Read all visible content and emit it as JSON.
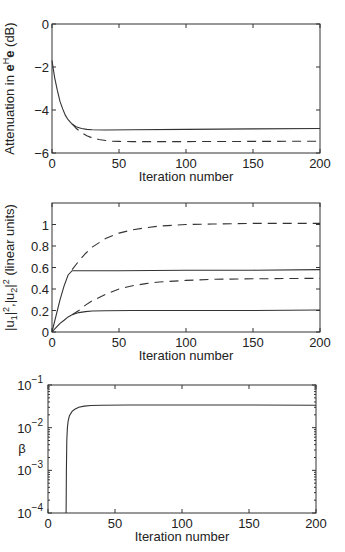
{
  "chart_data": [
    {
      "type": "line",
      "title": "",
      "xlabel": "Iteration number",
      "ylabel": "Attenuation in e^H e (dB)",
      "ylabel_parts": {
        "pre": "Attenuation in ",
        "bold": "e",
        "sup": "H",
        "bold2": "e",
        "post": " (dB)"
      },
      "xlim": [
        0,
        200
      ],
      "ylim": [
        -6,
        0
      ],
      "xticks": [
        0,
        50,
        100,
        150,
        200
      ],
      "yticks": [
        0,
        -2,
        -4,
        -6
      ],
      "grid": false,
      "series": [
        {
          "name": "solid",
          "style": "solid",
          "x": [
            0,
            1,
            2,
            4,
            6,
            8,
            10,
            12,
            15,
            18,
            22,
            26,
            30,
            40,
            60,
            100,
            150,
            200
          ],
          "y": [
            -1.7,
            -2.1,
            -2.5,
            -3.1,
            -3.6,
            -3.95,
            -4.25,
            -4.45,
            -4.65,
            -4.78,
            -4.86,
            -4.9,
            -4.92,
            -4.93,
            -4.92,
            -4.9,
            -4.88,
            -4.86
          ]
        },
        {
          "name": "dashed",
          "style": "dashed",
          "x": [
            15,
            18,
            22,
            26,
            30,
            35,
            40,
            45,
            50,
            60,
            80,
            100,
            150,
            200
          ],
          "y": [
            -4.65,
            -4.85,
            -5.05,
            -5.2,
            -5.3,
            -5.37,
            -5.42,
            -5.45,
            -5.46,
            -5.47,
            -5.47,
            -5.47,
            -5.46,
            -5.45
          ]
        }
      ]
    },
    {
      "type": "line",
      "title": "",
      "xlabel": "Iteration number",
      "ylabel": "|u1|^2, |u2|^2 (linear units)",
      "xlim": [
        0,
        200
      ],
      "ylim": [
        0,
        1.2
      ],
      "xticks": [
        0,
        50,
        100,
        150,
        200
      ],
      "yticks": [
        0,
        0.2,
        0.4,
        0.6,
        0.8,
        1
      ],
      "ytick_labels": [
        "0",
        "0.2",
        "0.4",
        "0.6",
        "0.8",
        "1"
      ],
      "grid": false,
      "series": [
        {
          "name": "u1 solid",
          "style": "solid",
          "x": [
            0,
            3,
            6,
            9,
            12,
            15,
            20,
            50,
            100,
            150,
            200
          ],
          "y": [
            0,
            0.15,
            0.3,
            0.43,
            0.53,
            0.57,
            0.57,
            0.57,
            0.575,
            0.575,
            0.58
          ]
        },
        {
          "name": "u1 dashed",
          "style": "dashed",
          "x": [
            15,
            20,
            25,
            30,
            40,
            50,
            60,
            70,
            80,
            100,
            120,
            150,
            200
          ],
          "y": [
            0.58,
            0.66,
            0.73,
            0.79,
            0.87,
            0.92,
            0.95,
            0.97,
            0.985,
            1.0,
            1.005,
            1.01,
            1.01
          ]
        },
        {
          "name": "u2 solid",
          "style": "solid",
          "x": [
            0,
            3,
            6,
            9,
            12,
            15,
            20,
            25,
            30,
            40,
            60,
            100,
            150,
            200
          ],
          "y": [
            0,
            0.04,
            0.08,
            0.11,
            0.14,
            0.16,
            0.18,
            0.19,
            0.195,
            0.198,
            0.2,
            0.2,
            0.2,
            0.205
          ]
        },
        {
          "name": "u2 dashed",
          "style": "dashed",
          "x": [
            15,
            20,
            25,
            30,
            40,
            50,
            60,
            70,
            80,
            100,
            120,
            150,
            200
          ],
          "y": [
            0.16,
            0.2,
            0.25,
            0.29,
            0.35,
            0.4,
            0.43,
            0.45,
            0.465,
            0.48,
            0.49,
            0.495,
            0.5
          ]
        }
      ]
    },
    {
      "type": "line",
      "title": "",
      "xlabel": "Iteration number",
      "ylabel": "β",
      "yscale": "log",
      "xlim": [
        0,
        200
      ],
      "ylim": [
        0.0001,
        0.1
      ],
      "xticks": [
        0,
        50,
        100,
        150,
        200
      ],
      "yticks": [
        0.1,
        0.01,
        0.001,
        0.0001
      ],
      "ytick_labels": [
        "10^-1",
        "10^-2",
        "10^-3",
        "10^-4"
      ],
      "grid": false,
      "series": [
        {
          "name": "beta",
          "style": "solid",
          "x": [
            13.5,
            13.7,
            14,
            14.5,
            15,
            16,
            18,
            20,
            23,
            27,
            32,
            40,
            60,
            100,
            150,
            200
          ],
          "y": [
            0.0001,
            0.001,
            0.005,
            0.01,
            0.014,
            0.019,
            0.024,
            0.027,
            0.03,
            0.032,
            0.033,
            0.0335,
            0.034,
            0.034,
            0.034,
            0.0335
          ]
        }
      ]
    }
  ]
}
